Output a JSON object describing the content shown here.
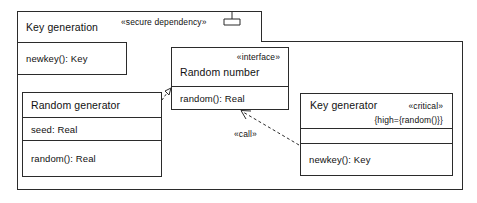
{
  "diagram": {
    "type": "uml-subsystem-diagram",
    "subsystem": {
      "name": "Key generation",
      "stereotype": "«secure dependency»",
      "icon": "subsystem-fork-icon",
      "operation": "newkey(): Key"
    },
    "classes": [
      {
        "id": "random-generator",
        "name": "Random generator",
        "attributes": [
          "seed: Real"
        ],
        "operations": [
          "random(): Real"
        ]
      },
      {
        "id": "random-number",
        "name": "Random number",
        "stereotype": "«interface»",
        "operations": [
          "random(): Real"
        ]
      },
      {
        "id": "key-generator",
        "name": "Key generator",
        "stereotype": "«critical»",
        "constraint": "{high={random()}}",
        "attributes": [],
        "operations": [
          "newkey(): Key"
        ]
      }
    ],
    "connectors": [
      {
        "id": "realization",
        "kind": "realization",
        "label": "",
        "from": "random-generator",
        "to": "random-number",
        "line": "dashed",
        "head": "hollow-triangle"
      },
      {
        "id": "call-dependency",
        "kind": "dependency",
        "label": "«call»",
        "from": "key-generator",
        "to": "random-number",
        "line": "dashed",
        "head": "open-arrow"
      }
    ],
    "colors": {
      "stroke": "#2b2b2b",
      "text": "#111111",
      "background": "#ffffff"
    }
  }
}
